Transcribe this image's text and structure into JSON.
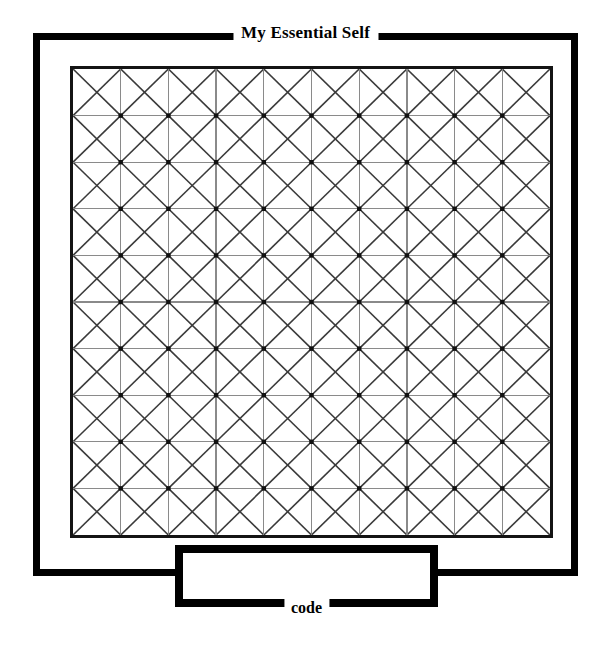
{
  "page": {
    "background_color": "#ffffff",
    "width": 613,
    "height": 649
  },
  "outer_panel": {
    "legend": "My Essential Self",
    "border_color": "#000000",
    "border_width_px": 7
  },
  "code_panel": {
    "legend": "code",
    "border_color": "#000000",
    "border_width_px": 8,
    "value": "",
    "placeholder": ""
  },
  "grid": {
    "columns": 10,
    "rows": 10,
    "cell_diagonals": "both",
    "border_color": "#141414",
    "line_color": "#8a8a8a",
    "diagonal_color": "#3a3a3a",
    "node_color": "#111111"
  },
  "chart_data": {
    "type": "heatmap",
    "title": "My Essential Self",
    "xlabel": "",
    "ylabel": "",
    "columns": 10,
    "rows": 10,
    "legend": [
      "My Essential Self",
      "code"
    ],
    "cells_all_marked": true
  }
}
